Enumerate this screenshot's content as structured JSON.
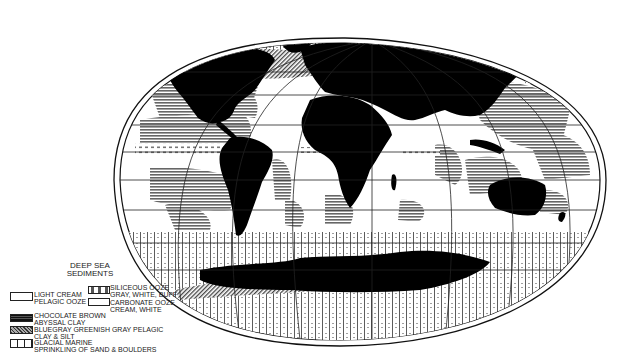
{
  "map": {
    "title": "Deep Sea Sediments World Map",
    "projection": "elliptical (Mollweide-like) world projection",
    "colors": {
      "land": "#000000",
      "ocean_background": "#ffffff",
      "pattern_ink": "#555555",
      "frame": "#111111"
    }
  },
  "legend": {
    "title_line1": "DEEP SEA",
    "title_line2": "SEDIMENTS",
    "items": [
      {
        "pattern": "blank",
        "line1": "LIGHT CREAM",
        "line2": "PELAGIC OOZE"
      },
      {
        "pattern": "dotted-dashes",
        "line1": "SILICEOUS OOZE",
        "line2": "GRAY, WHITE, BUFF"
      },
      {
        "pattern": "blank-small",
        "line1": "CARBONATE OOZE",
        "line2": "CREAM, WHITE"
      },
      {
        "pattern": "horizontal-lines-dark",
        "line1": "CHOCOLATE BROWN",
        "line2": "ABYSSAL CLAY"
      },
      {
        "pattern": "diagonal-hatch",
        "line1": "BLUEGRAY GREENISH GRAY PELAGIC",
        "line2": "CLAY & SILT"
      },
      {
        "pattern": "vertical-bars",
        "line1": "GLACIAL MARINE",
        "line2": "SPRINKLING OF SAND & BOULDERS"
      }
    ]
  }
}
